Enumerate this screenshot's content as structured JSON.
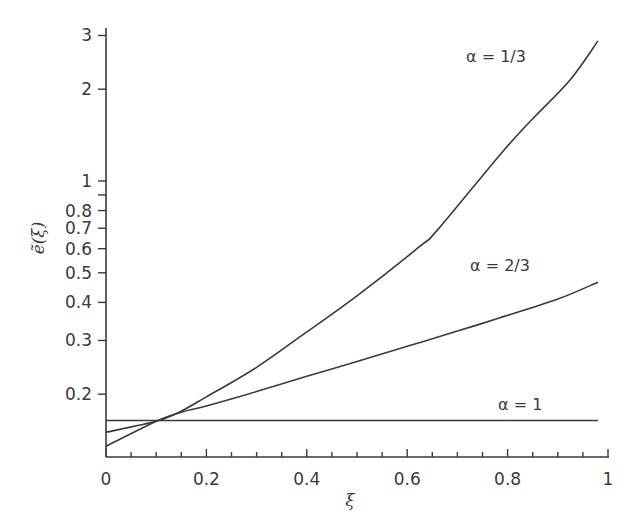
{
  "chart_data": {
    "type": "line",
    "title": "",
    "xlabel": "ξ",
    "ylabel": "ẽ(ξ)",
    "xlim": [
      0,
      1
    ],
    "ylim": [
      0.126,
      3.3
    ],
    "yscale": "log",
    "grid": false,
    "legend": "inline curve labels",
    "x_ticks": [
      0,
      0.2,
      0.4,
      0.6,
      0.8,
      1
    ],
    "x_tick_labels": [
      "0",
      "0.2",
      "0.4",
      "0.6",
      "0.8",
      "1"
    ],
    "x_minor_step": 0.05,
    "y_ticks": [
      0.2,
      0.3,
      0.4,
      0.5,
      0.6,
      0.7,
      0.8,
      0.9,
      1,
      2,
      3
    ],
    "y_tick_labels": [
      "0.2",
      "0.3",
      "0.4",
      "0.5",
      "0.6",
      "0.7",
      "0.8",
      "",
      "1",
      "2",
      "3"
    ],
    "series": [
      {
        "name": "α = 1/3",
        "label": "α = 1/3",
        "x": [
          0,
          0.1,
          0.147,
          0.2,
          0.3,
          0.4,
          0.5,
          0.625,
          0.66,
          0.785,
          0.85,
          0.924,
          0.98
        ],
        "values": [
          0.135,
          0.163,
          0.175,
          0.196,
          0.245,
          0.32,
          0.42,
          0.61,
          0.69,
          1.22,
          1.6,
          2.14,
          2.88
        ]
      },
      {
        "name": "α = 2/3",
        "label": "α = 2/3",
        "x": [
          0,
          0.1,
          0.147,
          0.2,
          0.3,
          0.4,
          0.5,
          0.6,
          0.7,
          0.785,
          0.9,
          0.98
        ],
        "values": [
          0.15,
          0.163,
          0.174,
          0.183,
          0.204,
          0.229,
          0.256,
          0.287,
          0.322,
          0.356,
          0.41,
          0.466
        ]
      },
      {
        "name": "α = 1",
        "label": "α = 1",
        "x": [
          0,
          0.2,
          0.4,
          0.6,
          0.8,
          0.98
        ],
        "values": [
          0.164,
          0.164,
          0.164,
          0.164,
          0.164,
          0.164
        ]
      }
    ],
    "annotations": [
      {
        "text": "α = 1/3",
        "x": 0.79,
        "y": 2.9
      },
      {
        "text": "α = 2/3",
        "x": 0.79,
        "y": 0.52
      },
      {
        "text": "α = 1",
        "x": 0.85,
        "y": 0.175
      }
    ]
  },
  "labels": {
    "xlabel": "ξ",
    "ylabel": "ẽ(ξ)",
    "series_1": "α = 1/3",
    "series_2": "α = 2/3",
    "series_3": "α = 1"
  },
  "colors": {
    "line": "#3a3a3a",
    "axis": "#3a3a3a",
    "background": "#ffffff"
  }
}
